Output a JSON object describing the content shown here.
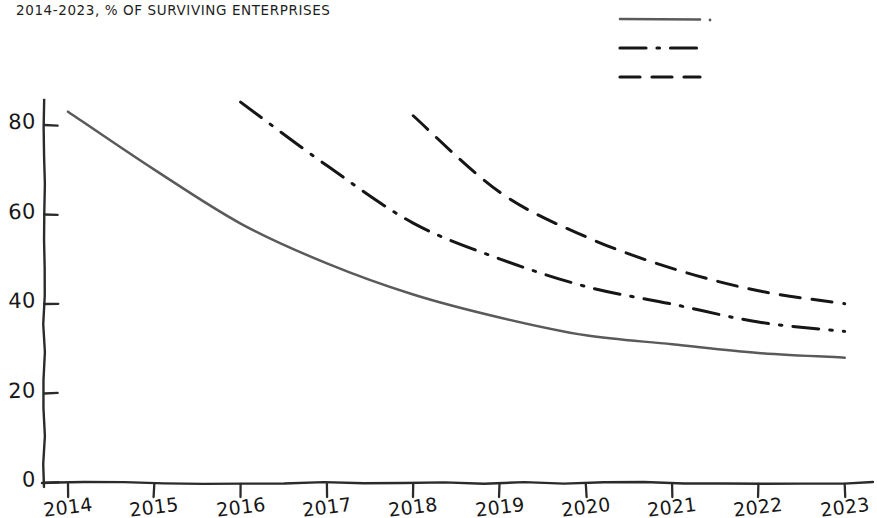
{
  "chart_title": "2014-2023, % OF SURVIVING ENTERPRISES",
  "axis": {
    "y_ticks": [
      "0",
      "20",
      "40",
      "60",
      "80"
    ],
    "x_ticks": [
      "2014",
      "2015",
      "2016",
      "2017",
      "2018",
      "2019",
      "2020",
      "2021",
      "2022",
      "2023"
    ]
  },
  "legend": {
    "items": [
      {
        "name": "series-1-swatch",
        "style": "solid",
        "color": "#5a5a5a"
      },
      {
        "name": "series-2-swatch",
        "style": "dashdot",
        "color": "#161616"
      },
      {
        "name": "series-3-swatch",
        "style": "dashed",
        "color": "#161616"
      }
    ]
  },
  "chart_data": {
    "type": "line",
    "title": "2014-2023, % OF SURVIVING ENTERPRISES",
    "xlabel": "",
    "ylabel": "",
    "x": [
      2014,
      2015,
      2016,
      2017,
      2018,
      2019,
      2020,
      2021,
      2022,
      2023
    ],
    "xlim": [
      2014,
      2023
    ],
    "ylim": [
      0,
      88
    ],
    "ytick_values": [
      0,
      20,
      40,
      60,
      80
    ],
    "grid": false,
    "legend_position": "top-right",
    "series": [
      {
        "name": "cohort-2014",
        "style": "solid",
        "color": "#5a5a5a",
        "x": [
          2014,
          2015,
          2016,
          2017,
          2018,
          2019,
          2020,
          2021,
          2022,
          2023
        ],
        "values": [
          83,
          70,
          58,
          49,
          42,
          37,
          33,
          31,
          29,
          28
        ]
      },
      {
        "name": "cohort-2016",
        "style": "dashdot",
        "color": "#161616",
        "x": [
          2016,
          2017,
          2018,
          2019,
          2020,
          2021,
          2022,
          2023
        ],
        "values": [
          85,
          71,
          58,
          50,
          44,
          40,
          36,
          34
        ]
      },
      {
        "name": "cohort-2018",
        "style": "dashed",
        "color": "#161616",
        "x": [
          2018,
          2019,
          2020,
          2021,
          2022,
          2023
        ],
        "values": [
          82,
          65,
          55,
          48,
          43,
          40
        ]
      }
    ]
  }
}
